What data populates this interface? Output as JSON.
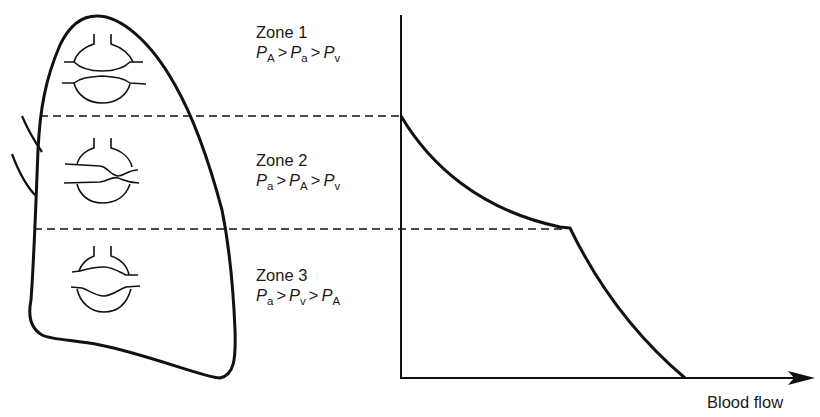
{
  "figure": {
    "x_axis_label": "Blood flow",
    "line_color": "#111111",
    "background": "#ffffff"
  },
  "zones": [
    {
      "title": "Zone 1",
      "terms": [
        {
          "sym": "P",
          "sub": "A"
        },
        {
          "sym": "P",
          "sub": "a"
        },
        {
          "sym": "P",
          "sub": "v"
        }
      ],
      "op": ">"
    },
    {
      "title": "Zone 2",
      "terms": [
        {
          "sym": "P",
          "sub": "a"
        },
        {
          "sym": "P",
          "sub": "A"
        },
        {
          "sym": "P",
          "sub": "v"
        }
      ],
      "op": ">"
    },
    {
      "title": "Zone 3",
      "terms": [
        {
          "sym": "P",
          "sub": "a"
        },
        {
          "sym": "P",
          "sub": "v"
        },
        {
          "sym": "P",
          "sub": "A"
        }
      ],
      "op": ">"
    }
  ]
}
